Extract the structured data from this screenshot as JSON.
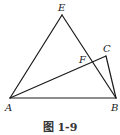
{
  "figure": {
    "caption": "图 1-9",
    "stroke_color": "#1a1a1a",
    "points": [
      {
        "name": "E",
        "x": 62,
        "y": 15,
        "lx": 58,
        "ly": 11
      },
      {
        "name": "A",
        "x": 10,
        "y": 98,
        "lx": 5,
        "ly": 111
      },
      {
        "name": "B",
        "x": 116,
        "y": 98,
        "lx": 111,
        "ly": 111
      },
      {
        "name": "C",
        "x": 106,
        "y": 56,
        "lx": 103,
        "ly": 52
      },
      {
        "name": "F",
        "x": 90,
        "y": 63,
        "lx": 79,
        "ly": 63
      }
    ],
    "segments": [
      [
        "A",
        "E"
      ],
      [
        "E",
        "B"
      ],
      [
        "A",
        "B"
      ],
      [
        "A",
        "C"
      ],
      [
        "C",
        "B"
      ]
    ]
  }
}
